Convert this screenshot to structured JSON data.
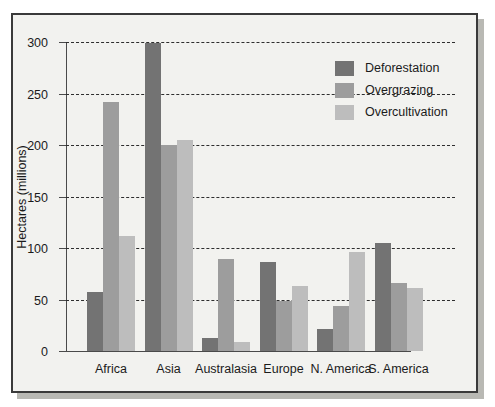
{
  "chart_data": {
    "type": "bar",
    "title": "",
    "subtitle": "",
    "xlabel": "",
    "ylabel": "Hectares (millions)",
    "ylim": [
      0,
      300
    ],
    "ytick_step": 50,
    "ytick_labels": [
      "0",
      "50",
      "100",
      "150",
      "200",
      "250",
      "300"
    ],
    "ytick_values": [
      0,
      50,
      100,
      150,
      200,
      250,
      300
    ],
    "grid": "horizontal-dashed",
    "legend_position": "top-right-inside",
    "categories": [
      "Africa",
      "Asia",
      "Australasia",
      "Europe",
      "N. America",
      "S. America"
    ],
    "series": [
      {
        "name": "Deforestation",
        "color": "#737373",
        "values": [
          57,
          299,
          13,
          86,
          21,
          105
        ]
      },
      {
        "name": "Overgrazing",
        "color": "#9d9d9d",
        "values": [
          242,
          200,
          89,
          49,
          44,
          66
        ]
      },
      {
        "name": "Overcultivation",
        "color": "#bdbdbd",
        "values": [
          112,
          205,
          9,
          63,
          96,
          61
        ]
      }
    ]
  },
  "figure": {
    "background": "#f2f2ef",
    "border_color": "#3a3a3a"
  }
}
